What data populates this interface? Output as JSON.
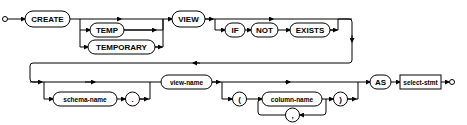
{
  "diagram": {
    "type": "syntax-railroad",
    "row1": {
      "create": "CREATE",
      "temp": "TEMP",
      "temporary": "TEMPORARY",
      "view": "VIEW",
      "if": "IF",
      "not": "NOT",
      "exists": "EXISTS"
    },
    "row2": {
      "schema_name": "schema-name",
      "dot": ".",
      "view_name": "view-name",
      "lparen": "(",
      "column_name": "column-name",
      "comma": ",",
      "rparen": ")",
      "as": "AS",
      "select_stmt": "select-stmt"
    }
  }
}
